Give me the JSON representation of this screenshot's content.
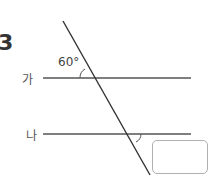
{
  "question": {
    "number": "3"
  },
  "diagram": {
    "lines": [
      {
        "label": "가"
      },
      {
        "label": "나"
      }
    ],
    "given_angle": "60°",
    "unknown_angle_answer": ""
  }
}
